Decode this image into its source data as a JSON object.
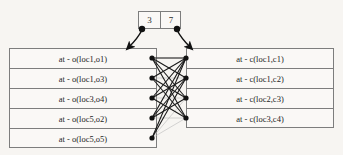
{
  "diagram": {
    "type": "bipartite-matching-graph",
    "background_color": "#f7f5f2",
    "border_color": "#7d7d7d",
    "edge_color_strong": "#1a1a1a",
    "edge_color_faint": "#b9b9b9",
    "node_color": "#111111"
  },
  "top_box": {
    "name": "index-pair-box",
    "cells": [
      {
        "value": "3"
      },
      {
        "value": "7"
      }
    ],
    "connectors": [
      {
        "name": "left-arrow",
        "from_cell": "3",
        "points_to": "left-table"
      },
      {
        "name": "right-arrow",
        "from_cell": "7",
        "points_to": "right-table"
      }
    ]
  },
  "left_table": {
    "name": "object-location-predicates",
    "rows": [
      {
        "label": "at - o(loc1,o1)"
      },
      {
        "label": "at - o(loc1,o3)"
      },
      {
        "label": "at - o(loc3,o4)"
      },
      {
        "label": "at - o(loc5,o2)"
      },
      {
        "label": "at - o(loc5,o5)"
      }
    ]
  },
  "right_table": {
    "name": "container-location-predicates",
    "rows": [
      {
        "label": "at - c(loc1,c1)"
      },
      {
        "label": "at - c(loc1,c2)"
      },
      {
        "label": "at - c(loc2,c3)"
      },
      {
        "label": "at - c(loc3,c4)"
      }
    ]
  },
  "edges": {
    "note": "links between left row nodes and right row nodes",
    "strong": [
      [
        0,
        0
      ],
      [
        0,
        1
      ],
      [
        0,
        2
      ],
      [
        0,
        3
      ],
      [
        1,
        0
      ],
      [
        1,
        2
      ],
      [
        1,
        3
      ],
      [
        2,
        0
      ],
      [
        2,
        1
      ],
      [
        2,
        3
      ],
      [
        3,
        0
      ],
      [
        3,
        1
      ],
      [
        3,
        2
      ],
      [
        4,
        0
      ],
      [
        4,
        1
      ]
    ],
    "faint": [
      [
        1,
        1
      ],
      [
        2,
        2
      ],
      [
        3,
        3
      ],
      [
        4,
        2
      ],
      [
        4,
        3
      ],
      [
        0,
        0
      ],
      [
        2,
        0
      ],
      [
        3,
        0
      ]
    ]
  }
}
